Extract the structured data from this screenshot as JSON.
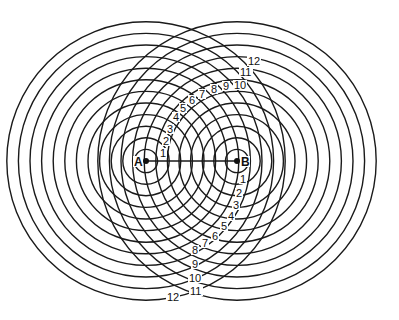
{
  "diagram": {
    "stroke_color": "#1a1a1a",
    "background": "#ffffff",
    "sources": [
      {
        "label": "A",
        "cx": 146,
        "cy": 161
      },
      {
        "label": "B",
        "cx": 237,
        "cy": 161
      }
    ],
    "circle_count": 12,
    "radius_step": 11.6,
    "connector": {
      "from": "A",
      "to": "B"
    },
    "upper_labels": [
      {
        "text": "1",
        "x": 160,
        "y": 157
      },
      {
        "text": "2",
        "x": 163,
        "y": 145
      },
      {
        "text": "3",
        "x": 167,
        "y": 133
      },
      {
        "text": "4",
        "x": 173,
        "y": 121
      },
      {
        "text": "5",
        "x": 180,
        "y": 112
      },
      {
        "text": "6",
        "x": 189,
        "y": 104
      },
      {
        "text": "7",
        "x": 199,
        "y": 98
      },
      {
        "text": "8",
        "x": 211,
        "y": 93
      },
      {
        "text": "9",
        "x": 223,
        "y": 90
      },
      {
        "text": "10",
        "x": 234,
        "y": 89
      },
      {
        "text": "11",
        "x": 240,
        "y": 76
      },
      {
        "text": "12",
        "x": 248,
        "y": 65
      }
    ],
    "lower_labels": [
      {
        "text": "1",
        "x": 240,
        "y": 183
      },
      {
        "text": "2",
        "x": 236,
        "y": 197
      },
      {
        "text": "3",
        "x": 233,
        "y": 209
      },
      {
        "text": "4",
        "x": 228,
        "y": 220
      },
      {
        "text": "5",
        "x": 221,
        "y": 230
      },
      {
        "text": "6",
        "x": 212,
        "y": 240
      },
      {
        "text": "7",
        "x": 202,
        "y": 247
      },
      {
        "text": "8",
        "x": 192,
        "y": 254
      },
      {
        "text": "9",
        "x": 192,
        "y": 268
      },
      {
        "text": "10",
        "x": 189,
        "y": 282
      },
      {
        "text": "11",
        "x": 190,
        "y": 295
      },
      {
        "text": "12",
        "x": 167,
        "y": 301
      }
    ]
  }
}
